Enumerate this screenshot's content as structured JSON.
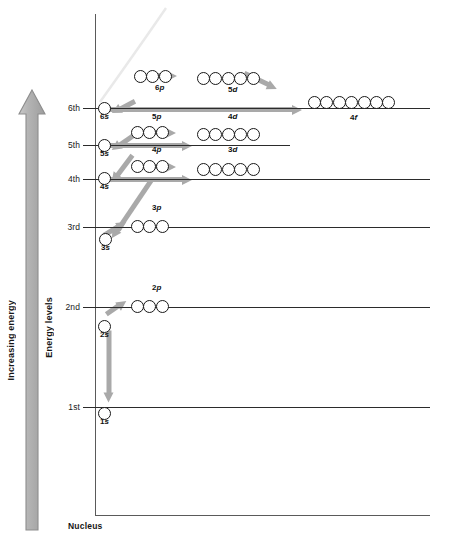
{
  "diagram": {
    "axis_labels": {
      "increasing_energy": "Increasing energy",
      "energy_levels": "Energy levels",
      "nucleus": "Nucleus"
    },
    "colors": {
      "arrow_gray": "#a9a9a9",
      "line_black": "#2b2b2b",
      "axis_gray": "#5a5a5a",
      "circle_stroke": "#181818",
      "background": "#ffffff"
    }
  },
  "levels": [
    {
      "id": "level-6",
      "label": "6th",
      "y": 108,
      "x_start": 95,
      "x_end": 430
    },
    {
      "id": "level-5",
      "label": "5th",
      "y": 145,
      "x_start": 95,
      "x_end": 290
    },
    {
      "id": "level-4",
      "label": "4th",
      "y": 179,
      "x_start": 95,
      "x_end": 430
    },
    {
      "id": "level-3",
      "label": "3rd",
      "y": 227,
      "x_start": 95,
      "x_end": 430
    },
    {
      "id": "level-2",
      "label": "2nd",
      "y": 307,
      "x_start": 95,
      "x_end": 430
    },
    {
      "id": "level-1",
      "label": "1st",
      "y": 407,
      "x_start": 95,
      "x_end": 430
    }
  ],
  "orbitals": [
    {
      "id": "orbital-1s",
      "n": 1,
      "subshell": "s",
      "label_n": "1",
      "label_l": "s",
      "count": 1,
      "x": 98,
      "y": 407,
      "label_x": 100,
      "label_y": 417
    },
    {
      "id": "orbital-2s",
      "n": 2,
      "subshell": "s",
      "label_n": "2",
      "label_l": "s",
      "count": 1,
      "x": 98,
      "y": 320,
      "label_x": 100,
      "label_y": 330
    },
    {
      "id": "orbital-2p",
      "n": 2,
      "subshell": "p",
      "label_n": "2",
      "label_l": "p",
      "count": 3,
      "x": 131,
      "y": 300,
      "label_x": 152,
      "label_y": 283
    },
    {
      "id": "orbital-3s",
      "n": 3,
      "subshell": "s",
      "label_n": "3",
      "label_l": "s",
      "count": 1,
      "x": 99,
      "y": 233,
      "label_x": 101,
      "label_y": 243
    },
    {
      "id": "orbital-3p",
      "n": 3,
      "subshell": "p",
      "label_n": "3",
      "label_l": "p",
      "count": 3,
      "x": 131,
      "y": 220,
      "label_x": 152,
      "label_y": 203
    },
    {
      "id": "orbital-4s",
      "n": 4,
      "subshell": "s",
      "label_n": "4",
      "label_l": "s",
      "count": 1,
      "x": 98,
      "y": 172,
      "label_x": 100,
      "label_y": 182
    },
    {
      "id": "orbital-4p",
      "n": 4,
      "subshell": "p",
      "label_n": "4",
      "label_l": "p",
      "count": 3,
      "x": 131,
      "y": 160,
      "label_x": 152,
      "label_y": 145
    },
    {
      "id": "orbital-3d",
      "n": 3,
      "subshell": "d",
      "label_n": "3",
      "label_l": "d",
      "count": 5,
      "x": 197,
      "y": 163,
      "label_x": 228,
      "label_y": 145
    },
    {
      "id": "orbital-5s",
      "n": 5,
      "subshell": "s",
      "label_n": "5",
      "label_l": "s",
      "count": 1,
      "x": 98,
      "y": 139,
      "label_x": 100,
      "label_y": 149
    },
    {
      "id": "orbital-5p",
      "n": 5,
      "subshell": "p",
      "label_n": "5",
      "label_l": "p",
      "count": 3,
      "x": 131,
      "y": 126,
      "label_x": 152,
      "label_y": 112
    },
    {
      "id": "orbital-4d",
      "n": 4,
      "subshell": "d",
      "label_n": "4",
      "label_l": "d",
      "count": 5,
      "x": 197,
      "y": 128,
      "label_x": 228,
      "label_y": 112
    },
    {
      "id": "orbital-6s",
      "n": 6,
      "subshell": "s",
      "label_n": "6",
      "label_l": "s",
      "count": 1,
      "x": 98,
      "y": 102,
      "label_x": 100,
      "label_y": 112
    },
    {
      "id": "orbital-6p",
      "n": 6,
      "subshell": "p",
      "label_n": "6",
      "label_l": "p",
      "count": 3,
      "x": 134,
      "y": 70,
      "label_x": 155,
      "label_y": 83
    },
    {
      "id": "orbital-5d",
      "n": 5,
      "subshell": "d",
      "label_n": "5",
      "label_l": "d",
      "count": 5,
      "x": 197,
      "y": 72,
      "label_x": 228,
      "label_y": 85
    },
    {
      "id": "orbital-4f",
      "n": 4,
      "subshell": "f",
      "label_n": "4",
      "label_l": "f",
      "count": 7,
      "x": 308,
      "y": 96,
      "label_x": 350,
      "label_y": 113
    }
  ],
  "aufbau_arrows": [
    {
      "id": "arrow-1s-2s",
      "from": "1s",
      "to": "2s",
      "x": 109,
      "y": 402,
      "length": 72,
      "angle": -90
    },
    {
      "id": "arrow-2s-2p",
      "from": "2s",
      "to": "2p",
      "x": 126,
      "y": 300,
      "length": 24,
      "angle": 145
    },
    {
      "id": "arrow-2p-3s",
      "from": "2p",
      "to": "3s",
      "x": 112,
      "y": 238,
      "length": 72,
      "angle": -56
    },
    {
      "id": "arrow-3s-3p",
      "from": "3s",
      "to": "3p",
      "x": 126,
      "y": 221,
      "length": 26,
      "angle": 148
    },
    {
      "id": "arrow-3p-4s",
      "from": "3p",
      "to": "4s",
      "x": 112,
      "y": 182,
      "length": 34,
      "angle": -53
    },
    {
      "id": "arrow-4s-3d",
      "from": "4s",
      "to": "3d",
      "x": 192,
      "y": 179,
      "length": 85,
      "angle": 180
    },
    {
      "id": "arrow-3d-4p",
      "from": "3d",
      "to": "4p",
      "x": 176,
      "y": 166,
      "length": 26,
      "angle": 180
    },
    {
      "id": "arrow-4p-5s",
      "from": "4p",
      "to": "5s",
      "x": 112,
      "y": 150,
      "length": 28,
      "angle": -35
    },
    {
      "id": "arrow-5s-4d",
      "from": "5s",
      "to": "4d",
      "x": 192,
      "y": 145,
      "length": 85,
      "angle": 180
    },
    {
      "id": "arrow-4d-5p",
      "from": "4d",
      "to": "5p",
      "x": 176,
      "y": 132,
      "length": 26,
      "angle": 180
    },
    {
      "id": "arrow-5p-6s",
      "from": "5p",
      "to": "6s",
      "x": 112,
      "y": 113,
      "length": 26,
      "angle": -28
    },
    {
      "id": "arrow-6s-4f",
      "from": "6s",
      "to": "4f",
      "x": 302,
      "y": 109,
      "length": 193,
      "angle": 180
    },
    {
      "id": "arrow-4f-5d",
      "from": "4f",
      "to": "5d",
      "x": 277,
      "y": 88,
      "length": 36,
      "angle": 205
    },
    {
      "id": "arrow-5d-6p",
      "from": "5d",
      "to": "6p",
      "x": 177,
      "y": 75,
      "length": 26,
      "angle": 180
    }
  ]
}
